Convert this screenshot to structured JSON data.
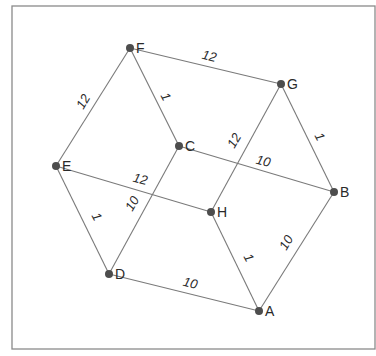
{
  "diagram": {
    "type": "weighted-undirected-graph",
    "nodes": [
      {
        "id": "A",
        "label": "A",
        "x": 259,
        "y": 311
      },
      {
        "id": "B",
        "label": "B",
        "x": 334,
        "y": 192
      },
      {
        "id": "C",
        "label": "C",
        "x": 179,
        "y": 146
      },
      {
        "id": "D",
        "label": "D",
        "x": 109,
        "y": 274
      },
      {
        "id": "E",
        "label": "E",
        "x": 56,
        "y": 166
      },
      {
        "id": "F",
        "label": "F",
        "x": 130,
        "y": 48
      },
      {
        "id": "G",
        "label": "G",
        "x": 281,
        "y": 84
      },
      {
        "id": "H",
        "label": "H",
        "x": 211,
        "y": 212
      }
    ],
    "edges": [
      {
        "from": "F",
        "to": "G",
        "weight": "12",
        "lx": 209,
        "ly": 57,
        "rot": 14
      },
      {
        "from": "F",
        "to": "E",
        "weight": "12",
        "lx": 84,
        "ly": 102,
        "rot": -60
      },
      {
        "from": "F",
        "to": "C",
        "weight": "1",
        "lx": 165,
        "ly": 97,
        "rot": 62
      },
      {
        "from": "G",
        "to": "B",
        "weight": "1",
        "lx": 319,
        "ly": 137,
        "rot": 62
      },
      {
        "from": "G",
        "to": "H",
        "weight": "12",
        "lx": 235,
        "ly": 141,
        "rot": -60
      },
      {
        "from": "C",
        "to": "B",
        "weight": "10",
        "lx": 263,
        "ly": 162,
        "rot": 14
      },
      {
        "from": "C",
        "to": "D",
        "weight": "10",
        "lx": 133,
        "ly": 204,
        "rot": -60
      },
      {
        "from": "E",
        "to": "H",
        "weight": "12",
        "lx": 140,
        "ly": 180,
        "rot": 14
      },
      {
        "from": "E",
        "to": "D",
        "weight": "1",
        "lx": 96,
        "ly": 217,
        "rot": 62
      },
      {
        "from": "H",
        "to": "A",
        "weight": "1",
        "lx": 248,
        "ly": 258,
        "rot": 62
      },
      {
        "from": "B",
        "to": "A",
        "weight": "10",
        "lx": 287,
        "ly": 243,
        "rot": -60
      },
      {
        "from": "D",
        "to": "A",
        "weight": "10",
        "lx": 190,
        "ly": 284,
        "rot": 14
      }
    ]
  },
  "style": {
    "node_color": "#4d4d4d",
    "edge_color": "#7a7a7a",
    "frame_color": "#8a8a8a"
  }
}
